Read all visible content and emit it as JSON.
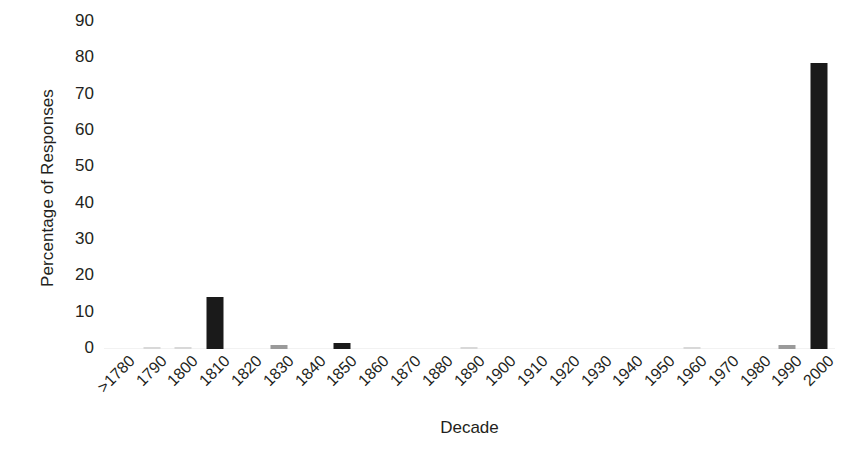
{
  "chart_data": {
    "type": "bar",
    "title": "",
    "xlabel": "Decade",
    "ylabel": "Percentage of Responses",
    "ylim": [
      0,
      90
    ],
    "yticks": [
      0,
      10,
      20,
      30,
      40,
      50,
      60,
      70,
      80,
      90
    ],
    "grid": false,
    "legend": null,
    "bar_color": "#1a1a1a",
    "categories": [
      ">1780",
      "1790",
      "1800",
      "1810",
      "1820",
      "1830",
      "1840",
      "1850",
      "1860",
      "1870",
      "1880",
      "1890",
      "1900",
      "1910",
      "1920",
      "1930",
      "1940",
      "1950",
      "1960",
      "1970",
      "1980",
      "1990",
      "2000"
    ],
    "values": [
      0,
      0.3,
      0.4,
      14.2,
      0,
      1.0,
      0,
      1.7,
      0,
      0,
      0,
      0.3,
      0,
      0,
      0,
      0,
      0,
      0,
      0.3,
      0,
      0,
      1.0,
      78.6
    ]
  },
  "axes": {
    "y_title": "Percentage of Responses",
    "x_title": "Decade",
    "y_tick_labels": [
      "90",
      "80",
      "70",
      "60",
      "50",
      "40",
      "30",
      "20",
      "10",
      "0"
    ]
  }
}
